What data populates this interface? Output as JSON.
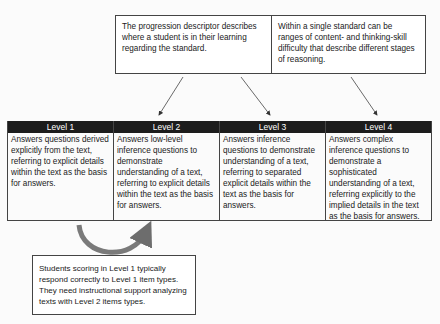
{
  "top_box": {
    "left_text": "The progression descriptor describes where a student is in their learning regarding the standard.",
    "right_text": "Within a single standard can be ranges of content- and thinking-skill difficulty that describe different stages of reasoning."
  },
  "levels": [
    {
      "label": "Level 1",
      "description": "Answers questions derived explicitly from the text, referring to explicit details within the text as the basis for answers."
    },
    {
      "label": "Level 2",
      "description": "Answers low-level inference questions to demonstrate understanding of a text, referring to explicit details within the text as the basis for answers."
    },
    {
      "label": "Level 3",
      "description": "Answers inference questions to demonstrate understanding of a text, referring to separated explicit details within the text as the basis for answers."
    },
    {
      "label": "Level 4",
      "description": "Answers complex inference questions to demonstrate a sophisticated understanding of a text, referring explicitly to the implied details in the text as the basis for answers."
    }
  ],
  "bottom_box": {
    "text": "Students scoring in Level 1 typically respond correctly to Level 1 item types. They need instructional support analyzing texts with Level 2 items types."
  },
  "colors": {
    "header_bg": "#1c1c1c",
    "header_text": "#ffffff",
    "border": "#444444",
    "curved_arrow": "#7a7a7a"
  }
}
